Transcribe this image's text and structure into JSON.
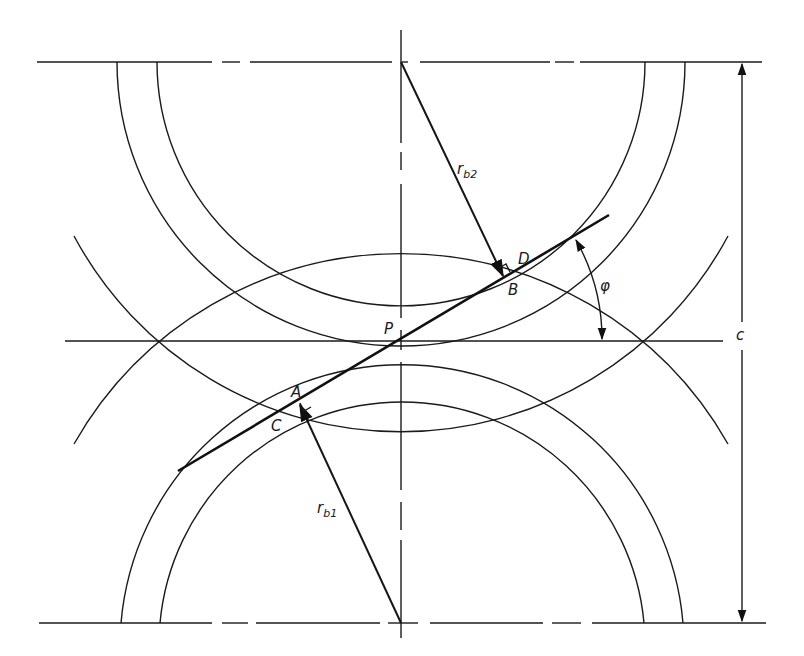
{
  "figure": {
    "type": "gear-mesh-geometry",
    "labels": {
      "pitch_point": "P",
      "point_a": "A",
      "point_b": "B",
      "point_c": "C",
      "point_d": "D",
      "base_radius_1": {
        "main": "r",
        "sub": "b1"
      },
      "base_radius_2": {
        "main": "r",
        "sub": "b2"
      },
      "pressure_angle": "φ",
      "center_distance": "c"
    }
  },
  "colors": {
    "line": "#1a1a1a",
    "background": "#ffffff"
  }
}
